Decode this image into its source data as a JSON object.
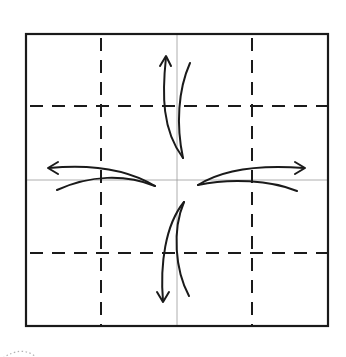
{
  "diagram": {
    "type": "origami-fold-step",
    "colors": {
      "background": "#ffffff",
      "ink": "#1a1a1a",
      "center_crease": "#9a9a9a",
      "dotted_mark": "#b0b0b0"
    },
    "square": {
      "x": 26,
      "y": 34,
      "width": 302,
      "height": 292
    },
    "dashed_lines": {
      "vertical_x": [
        101,
        252
      ],
      "horizontal_y": [
        106,
        253
      ]
    },
    "center_creases": {
      "x": 177,
      "y": 180
    },
    "arrows": [
      {
        "name": "up",
        "direction": "up"
      },
      {
        "name": "left",
        "direction": "left"
      },
      {
        "name": "right",
        "direction": "right"
      },
      {
        "name": "down",
        "direction": "down"
      }
    ]
  }
}
